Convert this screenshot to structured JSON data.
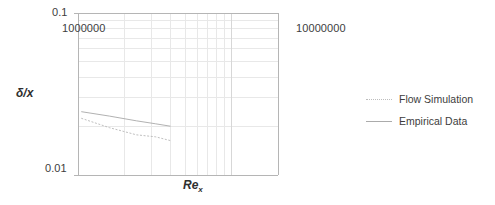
{
  "chart_data": {
    "type": "line",
    "title": "",
    "subtitle": "",
    "xlabel": "Re",
    "xlabel_sub": "x",
    "ylabel": "δ/x",
    "xscale": "log",
    "yscale": "log",
    "xlim": [
      1000000,
      20000000
    ],
    "ylim": [
      0.01,
      0.1
    ],
    "xtick_labels": [
      "1000000",
      "10000000"
    ],
    "xtick_values": [
      1000000,
      10000000
    ],
    "ytick_labels": [
      "0.1",
      "0.01"
    ],
    "ytick_values": [
      0.1,
      0.01
    ],
    "grid": true,
    "grid_minor": true,
    "legend_position": "right",
    "series": [
      {
        "name": "Flow Simulation",
        "style": "dotted",
        "color": "#b8b8b8",
        "x": [
          1050000,
          1600000,
          2400000,
          3200000,
          4000000
        ],
        "y": [
          0.0224,
          0.0196,
          0.0177,
          0.0172,
          0.0163
        ]
      },
      {
        "name": "Empirical Data",
        "style": "solid",
        "color": "#a8a8a8",
        "x": [
          1050000,
          1600000,
          2400000,
          3200000,
          4000000
        ],
        "y": [
          0.0246,
          0.0231,
          0.0216,
          0.0207,
          0.02
        ]
      }
    ]
  },
  "axis": {
    "y_max_label": "0.1",
    "y_min_label": "0.01",
    "x_min_label": "1000000",
    "x_max_label": "10000000",
    "y_title": "δ/x",
    "x_title": "Re",
    "x_title_sub": "x"
  },
  "legend": {
    "items": [
      {
        "label": "Flow Simulation",
        "style": "dotted",
        "color": "#bdbdbd"
      },
      {
        "label": "Empirical Data",
        "style": "solid",
        "color": "#ababab"
      }
    ]
  },
  "colors": {
    "grid_major": "#d7d7d7",
    "grid_minor": "#e8e8e8",
    "axis": "#b5b5b5",
    "text": "#3d3d3d",
    "background": "#ffffff"
  }
}
